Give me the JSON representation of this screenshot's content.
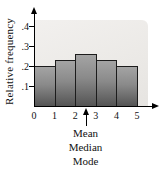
{
  "figure": {
    "ylabel": "Relative frequency"
  },
  "chart_data": {
    "type": "bar",
    "title": "",
    "subtitle": "",
    "categories": [
      "0-1",
      "1-2",
      "2-3",
      "3-4",
      "4-5"
    ],
    "values": [
      0.2,
      0.23,
      0.26,
      0.23,
      0.2
    ],
    "xlabel": "",
    "ylabel": "Relative frequency",
    "x_tick_labels": [
      "0",
      "1",
      "2",
      "3",
      "4",
      "5"
    ],
    "y_tick_labels": [
      ".1",
      ".2",
      ".3",
      ".4"
    ],
    "xlim": [
      0,
      6
    ],
    "ylim": [
      0,
      0.45
    ],
    "grid": false,
    "legend": "none",
    "annotation": {
      "lines": [
        "Mean",
        "Median",
        "Mode"
      ],
      "x": 2.5
    },
    "colors": {
      "bar_top": "#a4a4a4",
      "bar_bottom": "#545454",
      "bar_outline": "#1c1c1c",
      "plot_bg": "#ebe9e6",
      "axis": "#000000",
      "text": "#111111"
    }
  }
}
